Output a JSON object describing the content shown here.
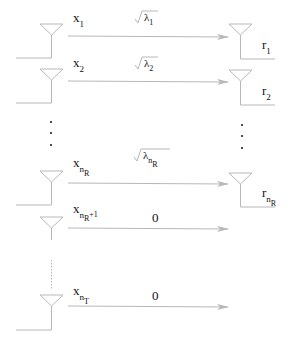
{
  "diagram": {
    "type": "MIMO channel decomposition (parallel eigen-channels)",
    "colors": {
      "line": "#b8b8b8",
      "text": "#111111",
      "background": "#ffffff"
    },
    "rows": [
      {
        "tx": {
          "base": "x",
          "sub": "1"
        },
        "gain": {
          "kind": "sqrt",
          "base": "λ",
          "sub": "1"
        },
        "rx": {
          "base": "r",
          "sub": "1"
        }
      },
      {
        "tx": {
          "base": "x",
          "sub": "2"
        },
        "gain": {
          "kind": "sqrt",
          "base": "λ",
          "sub": "2"
        },
        "rx": {
          "base": "r",
          "sub": "2"
        }
      },
      {
        "tx": {
          "base": "x",
          "sub": "n",
          "subsub": "R"
        },
        "gain": {
          "kind": "sqrt",
          "base": "λ",
          "sub": "n",
          "subsub": "R"
        },
        "rx": {
          "base": "r",
          "sub": "n",
          "subsub": "R"
        }
      },
      {
        "tx": {
          "base": "x",
          "sub": "n",
          "subsub": "R",
          "extra": "+1"
        },
        "gain": {
          "kind": "value",
          "value": "0"
        }
      },
      {
        "tx": {
          "base": "x",
          "sub": "n",
          "subsub": "T"
        },
        "gain": {
          "kind": "value",
          "value": "0"
        }
      }
    ],
    "ellipsis": "⋮"
  }
}
